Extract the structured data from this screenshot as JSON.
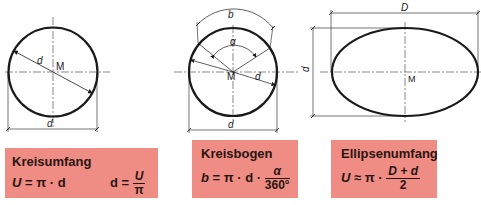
{
  "colors": {
    "box_bg": "#ef8c84",
    "line": "#1a1a1a",
    "text": "#2a1412"
  },
  "diagrams": {
    "circle": {
      "center_label": "M",
      "diameter_label": "d",
      "dim_label": "d"
    },
    "arc": {
      "center_label": "M",
      "arc_label": "b",
      "angle_label": "α",
      "diameter_label": "d",
      "dim_label": "d"
    },
    "ellipse": {
      "center_label": "M",
      "major_label": "D",
      "minor_label": "d"
    }
  },
  "boxes": [
    {
      "title": "Kreisumfang",
      "formula1": {
        "lhs": "U",
        "eq": "=",
        "rhs": "π · d"
      },
      "formula2": {
        "lhs": "d",
        "eq": "=",
        "num": "U",
        "den": "π"
      }
    },
    {
      "title": "Kreisbogen",
      "formula": {
        "lhs": "b",
        "eq": "=",
        "rhs": "π · d ·",
        "num": "α",
        "den": "360°"
      }
    },
    {
      "title": "Ellipsenumfang",
      "formula": {
        "lhs": "U",
        "eq": "≈",
        "rhs": "π ·",
        "num": "D + d",
        "den": "2"
      }
    }
  ]
}
